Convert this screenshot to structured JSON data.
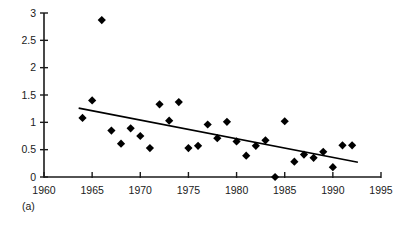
{
  "figure": {
    "panel_label": "(a)",
    "background_color": "#ffffff",
    "ink_color": "#000000"
  },
  "chart_data": {
    "type": "scatter",
    "title": "",
    "subtitle": "",
    "xlabel": "",
    "ylabel": "",
    "xlim": [
      1960,
      1995
    ],
    "ylim": [
      0,
      3
    ],
    "xticks": [
      1960,
      1965,
      1970,
      1975,
      1980,
      1985,
      1990,
      1995
    ],
    "xtick_labels": [
      "1960",
      "1965",
      "1970",
      "1975",
      "1980",
      "1985",
      "1990",
      "1995"
    ],
    "yticks": [
      0,
      0.5,
      1,
      1.5,
      2,
      2.5,
      3
    ],
    "ytick_labels": [
      "0",
      "0.5",
      "1",
      "1.5",
      "2",
      "2.5",
      "3"
    ],
    "grid": false,
    "legend": null,
    "legend_position": "none",
    "marker": "diamond",
    "marker_color": "#000000",
    "marker_size": 7,
    "x": [
      1964,
      1965,
      1966,
      1967,
      1968,
      1969,
      1970,
      1971,
      1972,
      1973,
      1974,
      1975,
      1976,
      1977,
      1978,
      1979,
      1980,
      1981,
      1982,
      1983,
      1984,
      1985,
      1986,
      1987,
      1988,
      1989,
      1990,
      1991,
      1992
    ],
    "y": [
      1.08,
      1.4,
      2.87,
      0.85,
      0.61,
      0.89,
      0.75,
      0.53,
      1.33,
      1.03,
      1.37,
      0.53,
      0.57,
      0.96,
      0.71,
      1.01,
      0.65,
      0.39,
      0.57,
      0.67,
      0.0,
      1.02,
      0.28,
      0.41,
      0.35,
      0.46,
      0.18,
      0.58,
      0.58
    ],
    "points": [
      {
        "x": 1964,
        "y": 1.08
      },
      {
        "x": 1965,
        "y": 1.4
      },
      {
        "x": 1966,
        "y": 2.87
      },
      {
        "x": 1967,
        "y": 0.85
      },
      {
        "x": 1968,
        "y": 0.61
      },
      {
        "x": 1969,
        "y": 0.89
      },
      {
        "x": 1970,
        "y": 0.75
      },
      {
        "x": 1971,
        "y": 0.53
      },
      {
        "x": 1972,
        "y": 1.33
      },
      {
        "x": 1973,
        "y": 1.03
      },
      {
        "x": 1974,
        "y": 1.37
      },
      {
        "x": 1975,
        "y": 0.53
      },
      {
        "x": 1976,
        "y": 0.57
      },
      {
        "x": 1977,
        "y": 0.96
      },
      {
        "x": 1978,
        "y": 0.71
      },
      {
        "x": 1979,
        "y": 1.01
      },
      {
        "x": 1980,
        "y": 0.65
      },
      {
        "x": 1981,
        "y": 0.39
      },
      {
        "x": 1982,
        "y": 0.57
      },
      {
        "x": 1983,
        "y": 0.67
      },
      {
        "x": 1984,
        "y": 0.0
      },
      {
        "x": 1985,
        "y": 1.02
      },
      {
        "x": 1986,
        "y": 0.28
      },
      {
        "x": 1987,
        "y": 0.41
      },
      {
        "x": 1988,
        "y": 0.35
      },
      {
        "x": 1989,
        "y": 0.46
      },
      {
        "x": 1990,
        "y": 0.18
      },
      {
        "x": 1991,
        "y": 0.58
      },
      {
        "x": 1992,
        "y": 0.58
      }
    ],
    "trendline": {
      "type": "linear",
      "x_start": 1963.6,
      "y_start": 1.26,
      "x_end": 1992.6,
      "y_end": 0.27
    }
  }
}
